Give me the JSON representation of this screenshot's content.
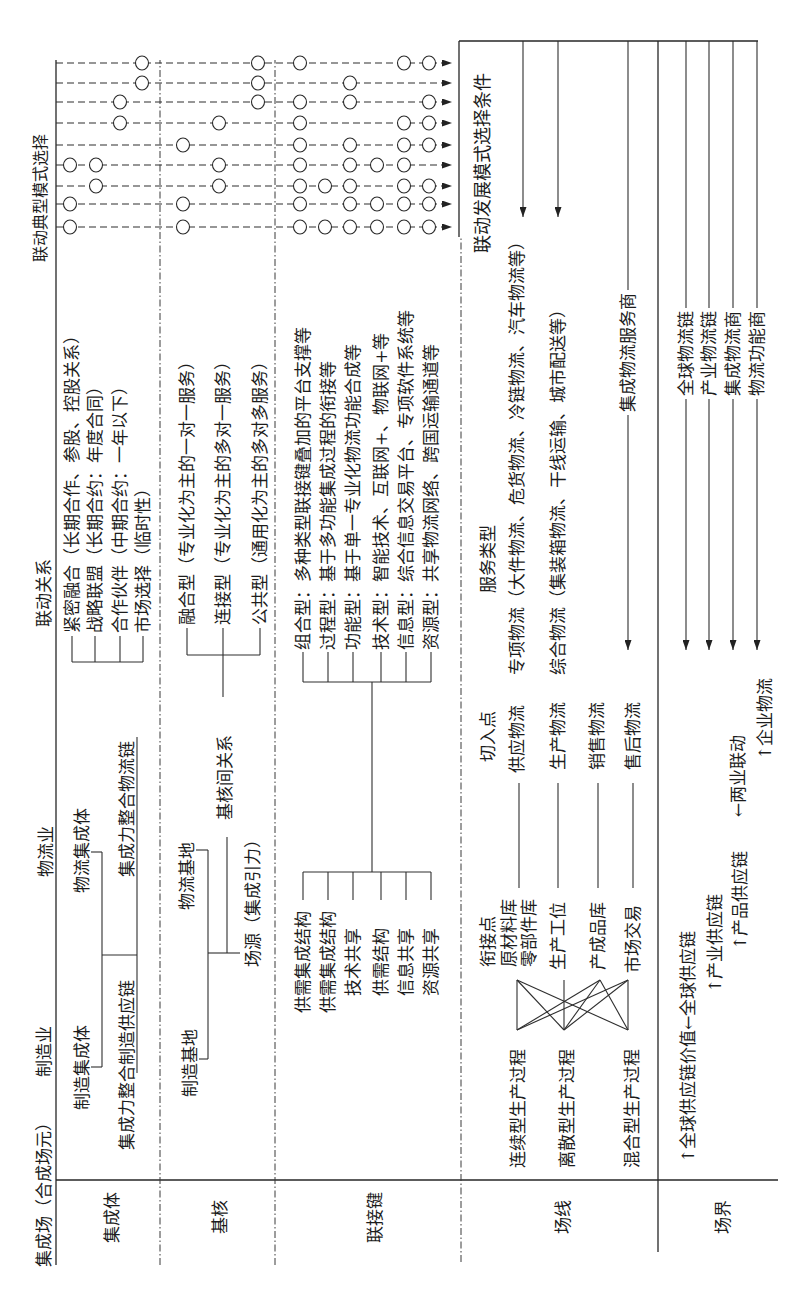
{
  "header": {
    "field": "集成场（合成场元）",
    "manufacturing": "制造业",
    "logistics": "物流业",
    "linkage_relation": "联动关系",
    "typical_mode_selection": "联动典型模式选择"
  },
  "row_labels": {
    "integration_body": "集成体",
    "base_core": "基核",
    "link_key": "联接键",
    "field_line": "场线",
    "field_boundary": "场界"
  },
  "integration_body": {
    "manufacturing_body": "制造集成体",
    "logistics_body": "物流集成体",
    "manufacturing_chain": "集成力整合制造供应链",
    "logistics_chain": "集成力整合物流链",
    "relations": [
      {
        "type": "紧密融合",
        "detail": "（长期合作、参股、控股关系）"
      },
      {
        "type": "战略联盟",
        "detail": "（长期合约：年度合同）"
      },
      {
        "type": "合作伙伴",
        "detail": "（中期合约：一年以下）"
      },
      {
        "type": "市场选择",
        "detail": "（临时性）"
      }
    ]
  },
  "base_core": {
    "manufacturing_base": "制造基地",
    "logistics_base": "物流基地",
    "field_source": "场源（集成引力）",
    "inter_core_relation": "基核间关系",
    "types": [
      {
        "type": "融合型",
        "detail": "（专业化为主的一对一服务）"
      },
      {
        "type": "连接型",
        "detail": "（专业化为主的多对一服务）"
      },
      {
        "type": "公共型",
        "detail": "（通用化为主的多对多服务）"
      }
    ]
  },
  "link_key": {
    "sources": [
      "供需集成结构",
      "供需集成结构",
      "技术共享",
      "供需结构",
      "信息共享",
      "资源共享"
    ],
    "separator": "：",
    "types": [
      {
        "type": "组合型",
        "detail": "多种类型联接键叠加的平台支撑等"
      },
      {
        "type": "过程型",
        "detail": "基于多功能集成过程的衔接等"
      },
      {
        "type": "功能型",
        "detail": "基于单一专业化物流功能合成等"
      },
      {
        "type": "技术型",
        "detail": "智能技术、互联网+、物联网+等"
      },
      {
        "type": "信息型",
        "detail": "综合信息交易平台、专项软件系统等"
      },
      {
        "type": "资源型",
        "detail": "共享物流网络、跨国运输通道等"
      }
    ]
  },
  "field_line": {
    "processes": [
      "连续型生产过程",
      "离散型生产过程",
      "混合型生产过程"
    ],
    "connection_point_label": "衔接点",
    "connection_points": [
      "原材料库",
      "零部件库",
      "生产工位",
      "产成品库",
      "市场交易"
    ],
    "entry_point_label": "切入点",
    "entry_points": [
      "供应物流",
      "生产物流",
      "销售物流",
      "售后物流"
    ],
    "service_type_label": "服务类型",
    "service_types": [
      "专项物流（大件物流、危货物流、冷链物流、汽车物流等）",
      "综合物流（集装箱物流、干线运输、城市配送等）"
    ],
    "integrated_provider": "集成物流服务商"
  },
  "field_boundary": {
    "global_value": "↑全球供应链价值←全球供应链",
    "industry_supply_chain": "↑产业供应链",
    "product_supply_chain": "↑产品供应链",
    "two_industry_linkage": "←两业联动",
    "enterprise_logistics": "↑企业物流",
    "logistics_levels": [
      "全球物流链",
      "产业物流链",
      "集成物流商",
      "物流功能商"
    ]
  },
  "selection_conditions": "联动发展模式选择条件",
  "typical_modes": [
    {
      "integration": [
        "紧密融合"
      ],
      "base_core": [
        "融合型"
      ],
      "link_key": [
        "组合型",
        "过程型",
        "功能型",
        "技术型",
        "信息型",
        "资源型"
      ]
    },
    {
      "integration": [
        "紧密融合"
      ],
      "base_core": [
        "融合型"
      ],
      "link_key": [
        "组合型",
        "功能型",
        "技术型",
        "信息型",
        "资源型"
      ]
    },
    {
      "integration": [
        "战略联盟"
      ],
      "base_core": [
        "连接型"
      ],
      "link_key": [
        "组合型",
        "过程型",
        "功能型",
        "信息型",
        "资源型"
      ]
    },
    {
      "integration": [
        "紧密融合",
        "战略联盟"
      ],
      "base_core": [
        "连接型"
      ],
      "link_key": [
        "组合型",
        "功能型",
        "技术型",
        "信息型"
      ]
    },
    {
      "integration": [],
      "base_core": [
        "融合型"
      ],
      "link_key": [
        "组合型",
        "功能型",
        "信息型",
        "资源型"
      ]
    },
    {
      "integration": [
        "合作伙伴"
      ],
      "base_core": [
        "连接型"
      ],
      "link_key": [
        "组合型",
        "信息型",
        "资源型"
      ]
    },
    {
      "integration": [
        "合作伙伴"
      ],
      "base_core": [
        "公共型"
      ],
      "link_key": [
        "组合型",
        "功能型",
        "资源型"
      ]
    },
    {
      "integration": [
        "市场选择"
      ],
      "base_core": [
        "公共型"
      ],
      "link_key": [
        "功能型"
      ]
    },
    {
      "integration": [
        "市场选择"
      ],
      "base_core": [
        "公共型"
      ],
      "link_key": [
        "组合型",
        "信息型",
        "资源型"
      ]
    }
  ]
}
